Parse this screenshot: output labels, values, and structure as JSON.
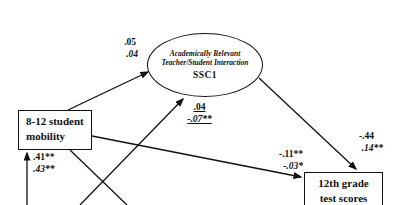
{
  "figure": {
    "latent": {
      "title_line1": "Academically Relevant",
      "title_line2": "Teacher/Student Interaction",
      "label": "SSC1"
    },
    "boxes": {
      "mobility": {
        "line1": "8-12 student",
        "line2": "mobility"
      },
      "test_scores": {
        "line1": "12th grade",
        "line2": "test scores"
      }
    },
    "coefficients": {
      "mobility_to_ssc1": {
        "v1": ".05",
        "v2": ".04"
      },
      "lower_to_ssc1": {
        "v1": ".04",
        "v2": "-.07**"
      },
      "lower_to_mobility": {
        "v1": ".41**",
        "v2": ".43**"
      },
      "mobility_to_test": {
        "v1": "-.11**",
        "v2": "-.03*"
      },
      "ssc1_to_test": {
        "v1": "-.44",
        "v2": ".14**"
      }
    },
    "colors": {
      "ink": "#111111",
      "paper": "#ffffff"
    }
  }
}
